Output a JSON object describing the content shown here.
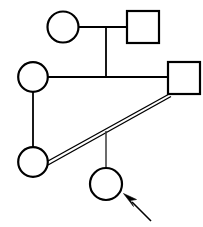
{
  "diagram": {
    "title": "Pedigree chart",
    "type": "family-pedigree",
    "background_color": "#ffffff",
    "stroke_color": "#000000",
    "notation": {
      "circle_meaning": "female",
      "square_meaning": "male",
      "double_line_meaning": "consanguineous mating",
      "arrow_meaning": "proband"
    },
    "individuals": [
      {
        "id": "I-1",
        "shape": "circle",
        "sex": "female",
        "generation": 1,
        "filled": false,
        "cx": 63,
        "cy": 27,
        "r": 15.5,
        "label": ""
      },
      {
        "id": "I-2",
        "shape": "square",
        "sex": "male",
        "generation": 1,
        "filled": false,
        "x": 127,
        "y": 11,
        "size": 32,
        "label": ""
      },
      {
        "id": "II-1",
        "shape": "circle",
        "sex": "female",
        "generation": 2,
        "filled": false,
        "cx": 33,
        "cy": 77,
        "r": 15,
        "label": ""
      },
      {
        "id": "II-2",
        "shape": "square",
        "sex": "male",
        "generation": 2,
        "filled": false,
        "x": 168,
        "y": 62,
        "size": 32,
        "label": ""
      },
      {
        "id": "III-1",
        "shape": "circle",
        "sex": "female",
        "generation": 3,
        "filled": false,
        "cx": 33,
        "cy": 162,
        "r": 15,
        "label": ""
      },
      {
        "id": "III-2",
        "shape": "circle",
        "sex": "female",
        "generation": 3,
        "filled": false,
        "cx": 106,
        "cy": 184,
        "r": 16,
        "proband": true,
        "label": ""
      }
    ],
    "connections": [
      {
        "id": "mating-gen1",
        "kind": "mating-line",
        "style": "single",
        "from": "I-1",
        "to": "I-2",
        "path": "M 78.5 27 L 127 27"
      },
      {
        "id": "descent-gen1",
        "kind": "descent-line",
        "style": "single",
        "from": "mating-gen1",
        "to": "mating-gen2",
        "path": "M 106 27 L 106 77"
      },
      {
        "id": "mating-gen2",
        "kind": "mating-line",
        "style": "single",
        "from": "II-1",
        "to": "II-2",
        "path": "M 48 77 L 168 77"
      },
      {
        "id": "descent-gen2",
        "kind": "descent-line",
        "style": "single",
        "from": "mating-gen2",
        "to": "III-1",
        "path": "M 33 92 L 33 147"
      },
      {
        "id": "consanguineous-mating",
        "kind": "mating-line",
        "style": "double",
        "from": "II-2",
        "to": "III-1",
        "path": "M 170 94 L 47 164"
      },
      {
        "id": "descent-proband",
        "kind": "descent-line",
        "style": "single",
        "from": "consanguineous-mating",
        "to": "III-2",
        "path": "M 106 132 L 106 168"
      }
    ],
    "proband_arrow": {
      "id": "proband-arrow",
      "shaft_path": "M 150 220 L 128 198",
      "tip_x": 124,
      "tip_y": 194,
      "direction": "up-left"
    }
  }
}
